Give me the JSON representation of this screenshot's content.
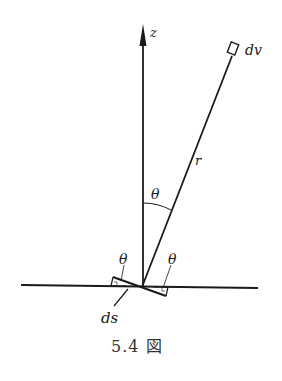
{
  "figure": {
    "caption": "5.4 図",
    "labels": {
      "z_axis": "z",
      "volume_element": "dv",
      "distance": "r",
      "angle_center": "θ",
      "angle_left": "θ",
      "angle_right": "θ",
      "surface_element": "ds"
    },
    "colors": {
      "ink": "#1a1a1a",
      "caption": "#333333",
      "background": "#ffffff"
    }
  }
}
